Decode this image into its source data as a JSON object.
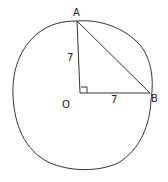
{
  "diagram": {
    "type": "geometry-circle-right-triangle",
    "points": {
      "A": {
        "label": "A",
        "x": 77,
        "y": 21
      },
      "O": {
        "label": "O",
        "x": 80,
        "y": 93
      },
      "B": {
        "label": "B",
        "x": 150,
        "y": 93
      }
    },
    "labels": {
      "point_a": "A",
      "point_b": "B",
      "center": "O",
      "side_oa": "7",
      "side_ob": "7"
    },
    "right_angle_at": "O",
    "stroke_color": "#333333"
  }
}
